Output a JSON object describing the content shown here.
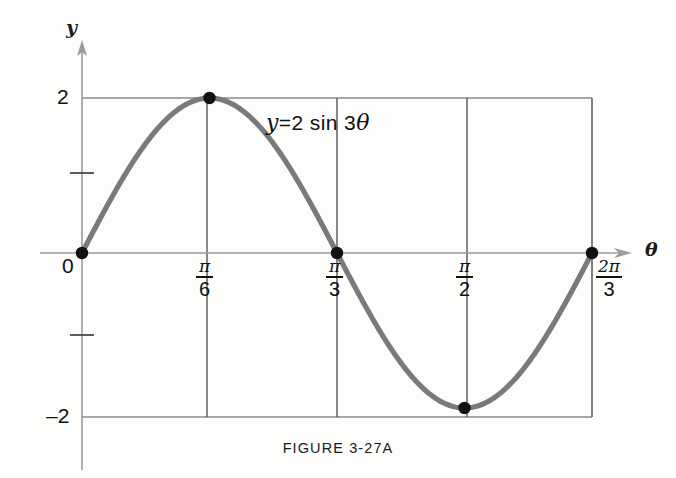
{
  "figure": {
    "caption": "FIGURE  3-27A"
  },
  "axes": {
    "y_axis_name": "y",
    "x_axis_name": "θ",
    "y_tick_top": "2",
    "y_tick_bottom": "–2",
    "origin_label": "0"
  },
  "equation": {
    "lhs": "y",
    "eq": "=2",
    "fn": "sin 3",
    "var": "θ",
    "full": "y = 2 sin 3θ"
  },
  "x_ticks": [
    {
      "num": "π",
      "den": "6",
      "label": "π/6"
    },
    {
      "num": "π",
      "den": "3",
      "label": "π/3"
    },
    {
      "num": "π",
      "den": "2",
      "label": "π/2"
    },
    {
      "num": "2π",
      "den": "3",
      "label": "2π/3"
    }
  ],
  "colors": {
    "curve": "#7a7a7a",
    "grid": "#8f8f8f",
    "axis": "#9a9a9a",
    "marker": "#111111",
    "text": "#111111",
    "background": "#fdfdfc"
  },
  "chart_data": {
    "type": "line",
    "title": "FIGURE  3-27A",
    "annotations": [
      "y = 2 sin 3θ"
    ],
    "xlabel": "θ",
    "ylabel": "y",
    "function": "y = 2 sin 3θ",
    "amplitude": 2,
    "frequency": 3,
    "period": "2π/3",
    "xlim": [
      0,
      2.0943951
    ],
    "ylim": [
      -2,
      2
    ],
    "xtick_values": [
      0,
      0.5235988,
      1.0471976,
      1.5707963,
      2.0943951
    ],
    "xtick_labels": [
      "0",
      "π/6",
      "π/3",
      "π/2",
      "2π/3"
    ],
    "ytick_values": [
      2,
      1,
      0,
      -1,
      -2
    ],
    "ytick_labels": [
      "2",
      "",
      "0",
      "",
      "–2"
    ],
    "grid": true,
    "legend": "none",
    "markers": [
      {
        "x": 0,
        "y": 0,
        "label": "0"
      },
      {
        "x": 0.5235988,
        "y": 2,
        "label": "π/6"
      },
      {
        "x": 1.0471976,
        "y": 0,
        "label": "π/3"
      },
      {
        "x": 1.5707963,
        "y": -2,
        "label": "π/2"
      },
      {
        "x": 2.0943951,
        "y": 0,
        "label": "2π/3"
      }
    ],
    "series": [
      {
        "name": "y = 2 sin 3θ",
        "x": [
          0,
          0.1047,
          0.2094,
          0.3142,
          0.4189,
          0.5236,
          0.6283,
          0.733,
          0.8378,
          0.9425,
          1.0472,
          1.1519,
          1.2566,
          1.3614,
          1.4661,
          1.5708,
          1.6755,
          1.7802,
          1.885,
          1.9897,
          2.0944
        ],
        "values": [
          0,
          0.618,
          1.176,
          1.618,
          1.902,
          2.0,
          1.902,
          1.618,
          1.176,
          0.618,
          0,
          -0.618,
          -1.176,
          -1.618,
          -1.902,
          -2.0,
          -1.902,
          -1.618,
          -1.176,
          -0.618,
          0
        ]
      }
    ]
  }
}
